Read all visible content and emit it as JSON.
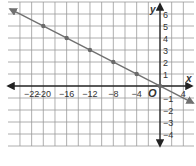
{
  "chart_data": {
    "type": "line",
    "title": "",
    "xlabel": "x",
    "ylabel": "y",
    "origin_label": "O",
    "xlim": [
      -25.7,
      6
    ],
    "ylim": [
      -5,
      7
    ],
    "grid": true,
    "x_tick_labels": [
      {
        "value": -22,
        "label": "−22"
      },
      {
        "value": -20,
        "label": "−20"
      },
      {
        "value": -16,
        "label": "−16"
      },
      {
        "value": -12,
        "label": "−12"
      },
      {
        "value": -8,
        "label": "−8"
      },
      {
        "value": -4,
        "label": "−4"
      },
      {
        "value": 4,
        "label": "4"
      }
    ],
    "y_tick_labels": [
      {
        "value": 6,
        "label": "6"
      },
      {
        "value": 5,
        "label": "5"
      },
      {
        "value": 4,
        "label": "4"
      },
      {
        "value": 3,
        "label": "3"
      },
      {
        "value": 2,
        "label": "2"
      },
      {
        "value": 1,
        "label": "1"
      },
      {
        "value": -1,
        "label": "−1"
      },
      {
        "value": -2,
        "label": "−2"
      },
      {
        "value": -3,
        "label": "−3"
      },
      {
        "value": -4,
        "label": "−4"
      }
    ],
    "series": [
      {
        "name": "y = -x/4",
        "equation": "y = -1/4 x",
        "line_from": [
          -25.7,
          6.42
        ],
        "line_to": [
          5.7,
          -1.42
        ],
        "points": [
          {
            "x": -20,
            "y": 5
          },
          {
            "x": -16,
            "y": 4
          },
          {
            "x": -12,
            "y": 3
          },
          {
            "x": -8,
            "y": 2
          },
          {
            "x": -4,
            "y": 1
          },
          {
            "x": 0,
            "y": 0
          }
        ]
      }
    ],
    "colors": {
      "grid": "#9a9a9a",
      "axis": "#222222",
      "line": "#707070",
      "point": "#6a6a6a",
      "text": "#333333"
    }
  }
}
